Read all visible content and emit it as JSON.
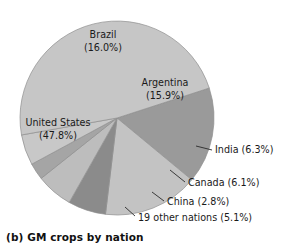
{
  "caption": "(b) GM crops by nation",
  "chart_data": {
    "type": "pie",
    "title": "(b) GM crops by nation",
    "xlabel": "",
    "ylabel": "",
    "legend_position": "none",
    "grid": false,
    "start_angle_deg": -18,
    "direction": "clockwise",
    "center": {
      "x": 117,
      "y": 118
    },
    "radius": 97,
    "labels": [
      "Brazil",
      "Argentina",
      "India",
      "Canada",
      "China",
      "19 other nations",
      "United States"
    ],
    "values": [
      16.0,
      15.9,
      6.3,
      6.1,
      2.8,
      5.1,
      47.8
    ],
    "slices": [
      {
        "name": "Brazil",
        "label": "Brazil",
        "value_text": "(16.0%)",
        "value": 16.0,
        "color": "#9a9a9a",
        "label_mode": "inside",
        "label_x": 103,
        "label_y": 38,
        "label_value_x": 103,
        "label_value_y": 51
      },
      {
        "name": "Argentina",
        "label": "Argentina",
        "value_text": "(15.9%)",
        "value": 15.9,
        "color": "#c3c3c3",
        "label_mode": "inside",
        "label_x": 165,
        "label_y": 86,
        "label_value_x": 165,
        "label_value_y": 99
      },
      {
        "name": "India",
        "label": "India (6.3%)",
        "value_text": "(6.3%)",
        "value": 6.3,
        "color": "#8b8b8b",
        "label_mode": "callout",
        "label_x": 215,
        "label_y": 153,
        "leader_x1": 196,
        "leader_y1": 146,
        "leader_x2": 212,
        "leader_y2": 150
      },
      {
        "name": "Canada",
        "label": "Canada (6.1%)",
        "value_text": "(6.1%)",
        "value": 6.1,
        "color": "#bdbdbd",
        "label_mode": "callout",
        "label_x": 188,
        "label_y": 186,
        "leader_x1": 170,
        "leader_y1": 170,
        "leader_x2": 185,
        "leader_y2": 182
      },
      {
        "name": "China",
        "label": "China (2.8%)",
        "value_text": "(2.8%)",
        "value": 2.8,
        "color": "#a5a5a5",
        "label_mode": "callout",
        "label_x": 167,
        "label_y": 205,
        "leader_x1": 152,
        "leader_y1": 192,
        "leader_x2": 164,
        "leader_y2": 201
      },
      {
        "name": "19 other nations",
        "label": "19 other nations (5.1%)",
        "value_text": "(5.1%)",
        "value": 5.1,
        "color": "#c8c8c8",
        "label_mode": "callout",
        "label_x": 138,
        "label_y": 221,
        "leader_x1": 125,
        "leader_y1": 207,
        "leader_x2": 135,
        "leader_y2": 216
      },
      {
        "name": "United States",
        "label": "United States",
        "value_text": "(47.8%)",
        "value": 47.8,
        "color": "#c6c6c6",
        "label_mode": "inside",
        "label_x": 58,
        "label_y": 126,
        "label_value_x": 58,
        "label_value_y": 139
      }
    ]
  }
}
